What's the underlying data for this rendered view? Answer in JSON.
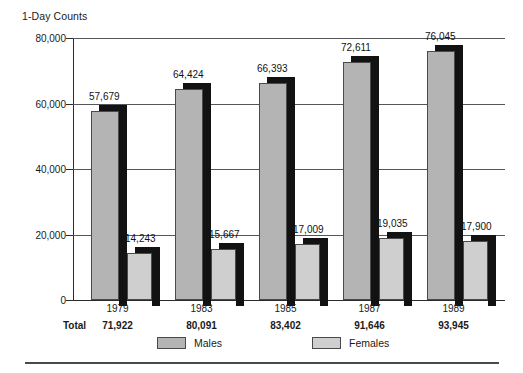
{
  "chart_data": {
    "type": "bar",
    "title": "1-Day Counts",
    "xlabel": "",
    "ylabel": "",
    "ylim": [
      0,
      80000
    ],
    "yticks": [
      "0",
      "20,000",
      "40,000",
      "60,000",
      "80,000"
    ],
    "ytick_values": [
      0,
      20000,
      40000,
      60000,
      80000
    ],
    "grid": true,
    "legend_position": "bottom",
    "categories": [
      "1979",
      "1983",
      "1985",
      "1987",
      "1989"
    ],
    "series": [
      {
        "name": "Males",
        "color": "#b4b4b4",
        "values": [
          57679,
          64424,
          66393,
          72611,
          76045
        ],
        "labels": [
          "57,679",
          "64,424",
          "66,393",
          "72,611",
          "76,045"
        ]
      },
      {
        "name": "Females",
        "color": "#cfcfcf",
        "values": [
          14243,
          15667,
          17009,
          19035,
          17900
        ],
        "labels": [
          "14,243",
          "15,667",
          "17,009",
          "19,035",
          "17,900"
        ]
      }
    ],
    "annotations": {
      "totals_caption": "Total",
      "totals": [
        71922,
        80091,
        83402,
        91646,
        93945
      ],
      "totals_labels": [
        "71,922",
        "80,091",
        "83,402",
        "91,646",
        "93,945"
      ]
    }
  },
  "colors": {
    "males_fill": "#b4b4b4",
    "females_fill": "#cfcfcf",
    "bar_depth": "#121212",
    "axis": "#2b2b2b",
    "gridline": "#53565a",
    "text": "#1a1a1a",
    "background": "#ffffff"
  }
}
